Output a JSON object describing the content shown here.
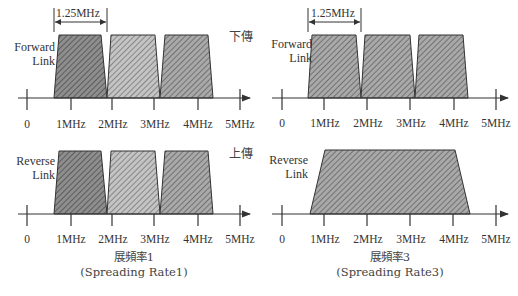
{
  "labels": {
    "forward_link": [
      "Forward",
      "Link"
    ],
    "reverse_link": [
      "Reverse",
      "Link"
    ],
    "downlink_cn": "下傳",
    "uplink_cn": "上傳",
    "bandwidth_marker": "1.25MHz"
  },
  "axis_ticks": [
    "0",
    "1MHz",
    "2MHz",
    "3MHz",
    "4MHz",
    "5MHz"
  ],
  "captions": {
    "left": {
      "cn": "展頻率1",
      "en": "(Spreading Rate1)"
    },
    "right": {
      "cn": "展頻率3",
      "en": "(Spreading Rate3)"
    }
  },
  "colors": {
    "dark_fill": "#8c8c8c",
    "mid_fill": "#a6a6a6",
    "light_fill": "#c2c2c2",
    "stroke": "#333333"
  },
  "panels": [
    {
      "id": "sr1-forward",
      "direction": "Forward Link",
      "carriers": 3,
      "carrier_bandwidth_mhz": 1.25
    },
    {
      "id": "sr3-forward",
      "direction": "Forward Link",
      "carriers": 3,
      "carrier_bandwidth_mhz": 1.25
    },
    {
      "id": "sr1-reverse",
      "direction": "Reverse Link",
      "carriers": 3,
      "carrier_bandwidth_mhz": 1.25
    },
    {
      "id": "sr3-reverse",
      "direction": "Reverse Link",
      "carriers": 1,
      "carrier_bandwidth_mhz": 3.75
    }
  ]
}
